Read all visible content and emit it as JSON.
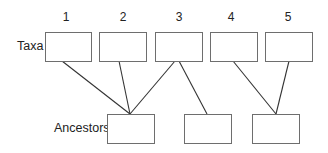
{
  "diagram": {
    "type": "phylogeny-taxa-ancestors",
    "row_labels": {
      "taxa": "Taxa",
      "ancestors": "Ancestors"
    },
    "taxa": [
      {
        "id": "1",
        "label": "1"
      },
      {
        "id": "2",
        "label": "2"
      },
      {
        "id": "3",
        "label": "3"
      },
      {
        "id": "4",
        "label": "4"
      },
      {
        "id": "5",
        "label": "5"
      }
    ],
    "ancestors": [
      {
        "id": "A1",
        "label": ""
      },
      {
        "id": "A2",
        "label": ""
      },
      {
        "id": "A3",
        "label": ""
      }
    ],
    "edges": [
      {
        "from": "1",
        "to": "A1"
      },
      {
        "from": "2",
        "to": "A1"
      },
      {
        "from": "3",
        "to": "A1"
      },
      {
        "from": "3",
        "to": "A2"
      },
      {
        "from": "4",
        "to": "A3"
      },
      {
        "from": "5",
        "to": "A3"
      }
    ],
    "colors": {
      "box_border": "#6e6e6e",
      "line": "#333333",
      "text": "#222222",
      "background": "#ffffff"
    }
  }
}
